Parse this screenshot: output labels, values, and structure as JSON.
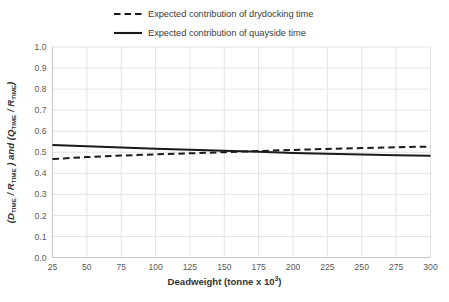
{
  "chart_data": {
    "type": "line",
    "title": "",
    "xlabel": "Deadweight (tonne x 10³)",
    "ylabel": "(D_TIME / R_TIME ) and (Q_TIME / R_TIME)",
    "xlim": [
      25,
      300
    ],
    "ylim": [
      0,
      1
    ],
    "grid": true,
    "legend_position": "top",
    "xticks": [
      25,
      50,
      75,
      100,
      125,
      150,
      175,
      200,
      225,
      250,
      275,
      300
    ],
    "xtick_labels": [
      "25",
      "50",
      "75",
      "100",
      "125",
      "150",
      "175",
      "200",
      "225",
      "250",
      "275",
      "300"
    ],
    "yticks": [
      0.0,
      0.1,
      0.2,
      0.3,
      0.4,
      0.5,
      0.6,
      0.7,
      0.8,
      0.9,
      1.0
    ],
    "ytick_labels": [
      "0.0",
      "0.1",
      "0.2",
      "0.3",
      "0.4",
      "0.5",
      "0.6",
      "0.7",
      "0.8",
      "0.9",
      "1.0"
    ],
    "x": [
      25,
      50,
      75,
      100,
      125,
      150,
      175,
      200,
      225,
      250,
      275,
      300
    ],
    "series": [
      {
        "name": "Expected contribution of drydocking time",
        "style": "dashed",
        "color": "#1a1a1a",
        "values": [
          0.468,
          0.477,
          0.484,
          0.49,
          0.495,
          0.5,
          0.506,
          0.511,
          0.516,
          0.52,
          0.524,
          0.527
        ]
      },
      {
        "name": "Expected contribution of quayside time",
        "style": "solid",
        "color": "#1a1a1a",
        "values": [
          0.535,
          0.529,
          0.523,
          0.517,
          0.512,
          0.507,
          0.502,
          0.497,
          0.493,
          0.489,
          0.486,
          0.483
        ]
      }
    ]
  },
  "legend": {
    "items": [
      {
        "label": "Expected contribution of drydocking time",
        "style": "dashed"
      },
      {
        "label": "Expected contribution of quayside time",
        "style": "solid"
      }
    ]
  },
  "axes": {
    "x_title_main": "Deadweight (tonne x 10",
    "x_title_exp": "3",
    "x_title_close": ")",
    "y_title_parts": {
      "p1": "(",
      "p2": "D",
      "p3": "TIME",
      "p4": " / ",
      "p5": "R",
      "p6": "TIME",
      "p7": " ) and (",
      "p8": "Q",
      "p9": "TIME",
      "p10": " / ",
      "p11": "R",
      "p12": "TIME",
      "p13": ")"
    }
  },
  "colors": {
    "grid": "#e3e3e3",
    "axis": "#c8c8c8",
    "line": "#1a1a1a",
    "tick_text": "#595959",
    "title_text": "#333333"
  }
}
